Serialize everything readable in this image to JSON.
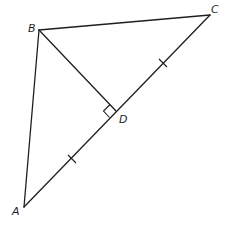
{
  "diagram": {
    "points": {
      "A": {
        "label": "A"
      },
      "B": {
        "label": "B"
      },
      "C": {
        "label": "C"
      },
      "D": {
        "label": "D"
      }
    },
    "segments": [
      "AB",
      "BC",
      "CA",
      "BD"
    ],
    "annotations": {
      "right_angle_at": "D",
      "right_angle_between": [
        "BD",
        "AC"
      ],
      "congruent_marks": [
        "AD",
        "DC"
      ],
      "tick_count_each": 1
    },
    "colors": {
      "stroke": "#1f1f1f",
      "background": "#ffffff"
    }
  }
}
